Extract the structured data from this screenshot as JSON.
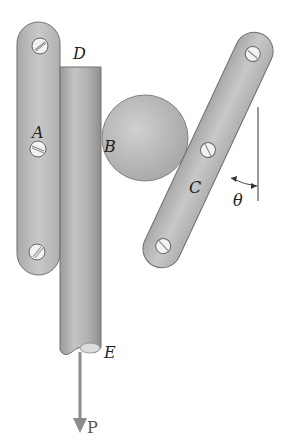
{
  "diagram": {
    "type": "mechanics-figure",
    "labels": {
      "D": "D",
      "A": "A",
      "B": "B",
      "C": "C",
      "E": "E",
      "theta": "θ",
      "P": "P"
    },
    "components": [
      {
        "id": "left-plate",
        "description": "vertical link plate with 3 screws, point A at middle screw"
      },
      {
        "id": "rod",
        "description": "vertical cylindrical rod from D (top) to E (broken bottom end)"
      },
      {
        "id": "ball",
        "description": "sphere B wedged between rod and inclined plate"
      },
      {
        "id": "right-plate",
        "description": "inclined link plate with 3 screws, point C at middle screw"
      },
      {
        "id": "angle-theta",
        "description": "angle θ between inclined plate and vertical reference line"
      },
      {
        "id": "force-P",
        "description": "downward force P applied at rod end E"
      }
    ],
    "colors": {
      "plate": "#b9b9b9",
      "rod": "#a8a8a8",
      "ball": "#bdbdbd",
      "outline": "#6f6f6f",
      "arrow": "#8c8c8c"
    }
  }
}
